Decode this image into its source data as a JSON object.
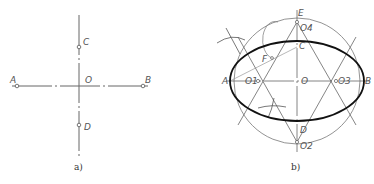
{
  "figure_a": {
    "caption": "a)",
    "labels": {
      "A": "A",
      "B": "B",
      "C": "C",
      "D": "D",
      "O": "O"
    }
  },
  "figure_b": {
    "caption": "b)",
    "labels": {
      "A": "A",
      "B": "B",
      "C": "C",
      "D": "D",
      "E": "E",
      "F": "F",
      "O": "O",
      "O1": "O1",
      "O2": "O2",
      "O3": "O3",
      "O4": "O4"
    }
  },
  "colors": {
    "thin": "#666666",
    "thick": "#111111",
    "label": "#555555"
  }
}
